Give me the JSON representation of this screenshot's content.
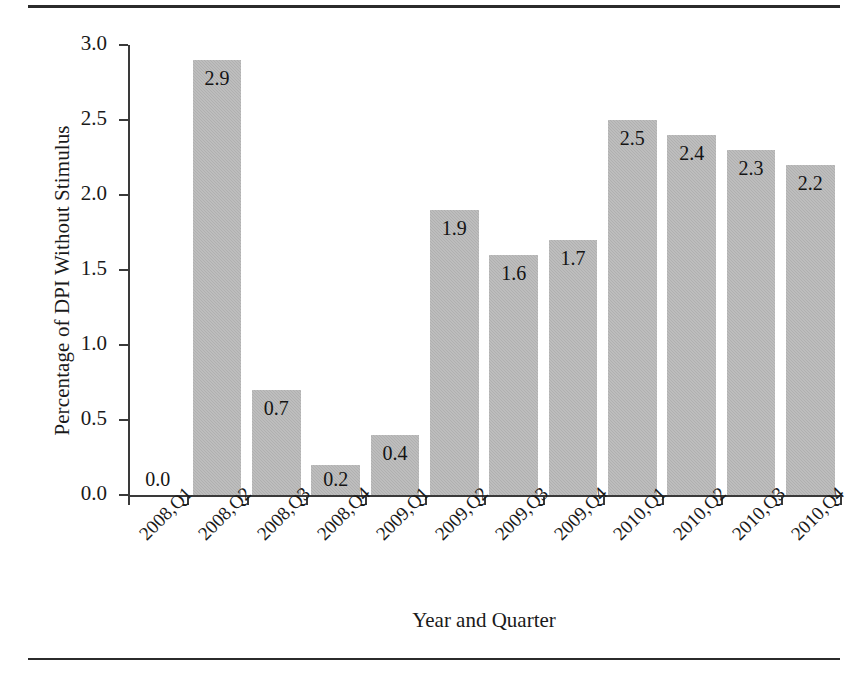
{
  "chart_data": {
    "type": "bar",
    "title": "",
    "xlabel": "Year and Quarter",
    "ylabel": "Percentage of DPI Without Stimulus",
    "categories": [
      "2008,Q1",
      "2008,Q2",
      "2008,Q3",
      "2008,Q4",
      "2009,Q1",
      "2009,Q2",
      "2009,Q3",
      "2009,Q4",
      "2010,Q1",
      "2010,Q2",
      "2010,Q3",
      "2010,Q4"
    ],
    "values": [
      0.0,
      2.9,
      0.7,
      0.2,
      0.4,
      1.9,
      1.6,
      1.7,
      2.5,
      2.4,
      2.3,
      2.2
    ],
    "value_labels": [
      "0.0",
      "2.9",
      "0.7",
      "0.2",
      "0.4",
      "1.9",
      "1.6",
      "1.7",
      "2.5",
      "2.4",
      "2.3",
      "2.2"
    ],
    "ylim": [
      0.0,
      3.0
    ],
    "ytick_values": [
      0.0,
      0.5,
      1.0,
      1.5,
      2.0,
      2.5,
      3.0
    ],
    "ytick_labels": [
      "0.0",
      "0.5",
      "1.0",
      "1.5",
      "2.0",
      "2.5",
      "3.0"
    ],
    "grid": false,
    "legend": false,
    "legend_position": "none",
    "bar_color": "#b0b0b0",
    "axis_color": "#3a3a3a",
    "text_color": "#1a1a1a",
    "label_placement": "inside-top",
    "xtick_label_rotation": -45
  }
}
